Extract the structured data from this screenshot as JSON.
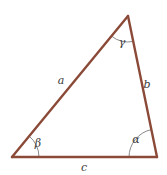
{
  "figure": {
    "background_color": "#ffffff",
    "stroke_color": "#8B4A38",
    "arc_color": "#6b6b6b",
    "label_color": "#3a3a3a",
    "stroke_width": 2.4,
    "arc_width": 0.8
  },
  "vertices": {
    "apex": {
      "name": "top-vertex",
      "x": 128,
      "y": 16
    },
    "bottom_left": {
      "name": "bottom-left-vertex",
      "x": 12,
      "y": 157
    },
    "bottom_right": {
      "name": "bottom-right-vertex",
      "x": 157,
      "y": 157
    }
  },
  "sides": [
    {
      "id": "a",
      "label": "a",
      "description": "left side from bottom-left vertex to apex",
      "label_x": 61,
      "label_y": 84
    },
    {
      "id": "b",
      "label": "b",
      "description": "right side from apex to bottom-right vertex",
      "label_x": 147,
      "label_y": 88
    },
    {
      "id": "c",
      "label": "c",
      "description": "base from bottom-left vertex to bottom-right vertex",
      "label_x": 84,
      "label_y": 171
    }
  ],
  "angles": [
    {
      "id": "gamma",
      "label": "γ",
      "description": "angle at the apex vertex",
      "label_x": 122,
      "label_y": 46,
      "arc_radius": 26
    },
    {
      "id": "beta",
      "label": "β",
      "description": "angle at the bottom-left vertex",
      "label_x": 38,
      "label_y": 147,
      "arc_radius": 27
    },
    {
      "id": "alpha",
      "label": "α",
      "description": "angle at the bottom-right vertex",
      "label_x": 136,
      "label_y": 143,
      "arc_radius": 28
    }
  ]
}
